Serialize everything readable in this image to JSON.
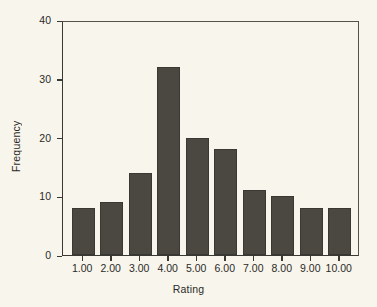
{
  "chart_data": {
    "type": "bar",
    "title": "",
    "xlabel": "Rating",
    "ylabel": "Frequency",
    "categories": [
      "1.00",
      "2.00",
      "3.00",
      "4.00",
      "5.00",
      "6.00",
      "7.00",
      "8.00",
      "9.00",
      "10.00"
    ],
    "values": [
      8,
      9,
      14,
      32,
      20,
      18,
      11,
      10,
      8,
      8
    ],
    "ylim": [
      0,
      40
    ],
    "yticks": [
      0,
      10,
      20,
      30,
      40
    ],
    "ytick_labels": [
      "0",
      "10",
      "20",
      "30",
      "40"
    ],
    "grid": false,
    "legend": "none",
    "bar_color": "#4b4841",
    "background_color": "#f7f5ec",
    "axis_color": "#3a3833"
  }
}
